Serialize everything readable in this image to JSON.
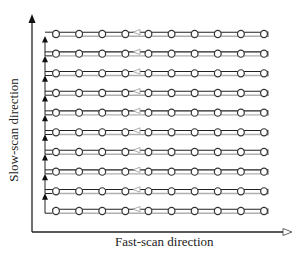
{
  "diagram": {
    "type": "raster-scan-pattern",
    "axes": {
      "x_label": "Fast-scan direction",
      "y_label": "Slow-scan direction"
    },
    "rows": 10,
    "points_per_row": 10,
    "colors": {
      "scan_line": "#222222",
      "return_line": "#b0b0b0",
      "axis": "#222222",
      "point_stroke": "#333333"
    }
  }
}
